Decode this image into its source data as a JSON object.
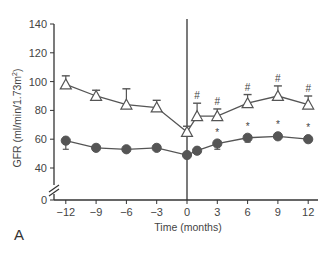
{
  "chart_data": {
    "type": "line",
    "title": "",
    "panel_label": "A",
    "xlabel": "Time (months)",
    "ylabel": "GFR (ml/min/1.73m²)",
    "ylabel_main": "GFR (ml/min/1.73m",
    "ylabel_sup": "2",
    "ylabel_close": ")",
    "xlim": [
      -13,
      13
    ],
    "ylim": [
      0,
      140
    ],
    "y_axis_break": true,
    "x_ticks": [
      -12,
      -9,
      -6,
      -3,
      0,
      3,
      6,
      9,
      12
    ],
    "x_tick_labels": [
      "−12",
      "−9",
      "−6",
      "−3",
      "0",
      "3",
      "6",
      "9",
      "12"
    ],
    "y_ticks": [
      0,
      40,
      60,
      80,
      100,
      120,
      140
    ],
    "y_tick_labels": [
      "0",
      "40",
      "60",
      "80",
      "100",
      "120",
      "140"
    ],
    "grid": false,
    "vertical_reference_line_x": 0,
    "series": [
      {
        "name": "open-triangle series",
        "marker": "open-triangle",
        "color": "#555555",
        "x": [
          -12,
          -9,
          -6,
          -3,
          0,
          1,
          3,
          6,
          9,
          12
        ],
        "values": [
          98,
          90,
          84,
          82,
          65,
          76,
          76,
          85,
          90,
          84
        ],
        "error_upper": [
          6,
          4,
          11,
          5,
          4,
          9,
          5,
          6,
          7,
          6
        ],
        "significance": [
          "",
          "",
          "",
          "",
          "",
          "#",
          "#",
          "#",
          "#",
          "#"
        ]
      },
      {
        "name": "filled-circle series",
        "marker": "filled-circle",
        "color": "#555555",
        "x": [
          -12,
          -9,
          -6,
          -3,
          0,
          1,
          3,
          6,
          9,
          12
        ],
        "values": [
          59,
          54,
          53,
          54,
          49,
          52,
          57,
          61,
          62,
          60
        ],
        "error_lower": [
          6,
          0,
          0,
          0,
          0,
          0,
          4,
          3,
          2,
          2
        ],
        "significance": [
          "",
          "",
          "",
          "",
          "",
          "",
          "*",
          "*",
          "*",
          "*"
        ]
      }
    ]
  }
}
